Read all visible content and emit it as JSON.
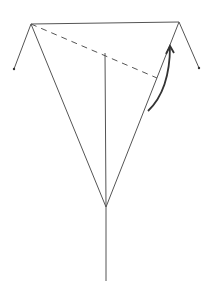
{
  "diagram": {
    "type": "origami-fold-step",
    "width": 216,
    "height": 282,
    "background": "#ffffff",
    "stroke_color": "#555555",
    "arrow_color": "#333333",
    "points": {
      "top_left": [
        31,
        24
      ],
      "top_right": [
        179,
        22
      ],
      "left_flap_tip": [
        14,
        69
      ],
      "right_flap_tip": [
        199,
        68
      ],
      "bottom_vertex": [
        106,
        207
      ],
      "stem_end": [
        106,
        281
      ],
      "center_line_top": [
        105,
        53
      ],
      "dash_end": [
        157,
        78
      ]
    },
    "lines": [
      {
        "name": "top-edge",
        "from": "top_left",
        "to": "top_right",
        "style": "solid"
      },
      {
        "name": "left-flap",
        "from": "top_left",
        "to": "left_flap_tip",
        "style": "solid"
      },
      {
        "name": "right-flap",
        "from": "top_right",
        "to": "right_flap_tip",
        "style": "solid"
      },
      {
        "name": "left-diagonal",
        "from": "top_left",
        "to": "bottom_vertex",
        "style": "solid"
      },
      {
        "name": "right-diagonal",
        "from": "top_right",
        "to": "bottom_vertex",
        "style": "solid"
      },
      {
        "name": "center-crease",
        "from": "center_line_top",
        "to": "bottom_vertex",
        "style": "solid"
      },
      {
        "name": "stem",
        "from": "bottom_vertex",
        "to": "stem_end",
        "style": "solid"
      },
      {
        "name": "fold-line",
        "from": "top_left",
        "to": "dash_end",
        "style": "dashed"
      }
    ],
    "arrow": {
      "name": "fold-direction-arrow",
      "start": [
        148,
        111
      ],
      "control": [
        170,
        90
      ],
      "end": [
        170,
        46
      ],
      "meaning": "fold up"
    }
  }
}
